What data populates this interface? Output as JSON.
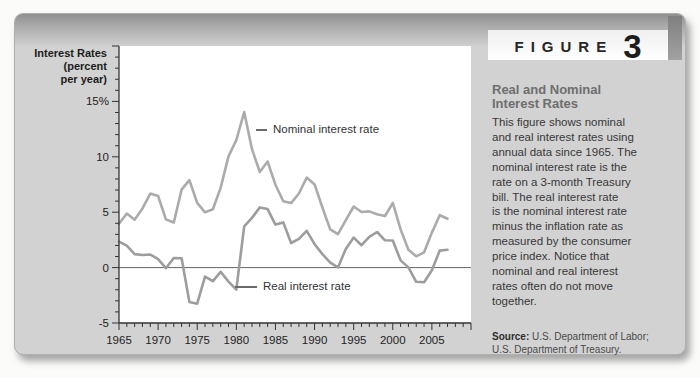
{
  "figure": {
    "label": "FIGURE",
    "number": "3"
  },
  "panel": {
    "heading": "Real and Nominal\nInterest Rates",
    "body": "This figure shows nominal\nand real interest rates using\nannual data since 1965. The\nnominal interest rate is the\nrate on a 3-month Treasury\nbill. The real interest rate\nis the nominal interest rate\nminus the inflation rate as\nmeasured by the consumer\nprice index. Notice that\nnominal and real interest\nrates often do not move\ntogether.",
    "source_label": "Source:",
    "source_text": " U.S. Department of Labor;\nU.S. Department of Treasury."
  },
  "chart_data": {
    "type": "line",
    "title": "",
    "y_axis_title": "Interest Rates\n(percent\nper year)",
    "xlabel": "",
    "ylabel": "Interest Rates (percent per year)",
    "xlim": [
      1965,
      2010
    ],
    "ylim": [
      -5,
      20
    ],
    "grid": false,
    "zero_line": true,
    "legend_position": "inline-annotations",
    "minor_tick_step_x": 1,
    "minor_tick_step_y": 1,
    "x": [
      1965,
      1966,
      1967,
      1968,
      1969,
      1970,
      1971,
      1972,
      1973,
      1974,
      1975,
      1976,
      1977,
      1978,
      1979,
      1980,
      1981,
      1982,
      1983,
      1984,
      1985,
      1986,
      1987,
      1988,
      1989,
      1990,
      1991,
      1992,
      1993,
      1994,
      1995,
      1996,
      1997,
      1998,
      1999,
      2000,
      2001,
      2002,
      2003,
      2004,
      2005,
      2006,
      2007
    ],
    "series": [
      {
        "name": "Nominal interest rate",
        "color": "#ababab",
        "values": [
          3.95,
          4.88,
          4.32,
          5.34,
          6.68,
          6.46,
          4.35,
          4.07,
          7.04,
          7.89,
          5.84,
          4.99,
          5.27,
          7.22,
          10.04,
          11.51,
          14.03,
          10.69,
          8.63,
          9.58,
          7.48,
          5.98,
          5.82,
          6.69,
          8.12,
          7.51,
          5.42,
          3.45,
          3.02,
          4.29,
          5.51,
          5.02,
          5.07,
          4.81,
          4.66,
          5.85,
          3.45,
          1.62,
          1.02,
          1.38,
          3.16,
          4.73,
          4.41
        ]
      },
      {
        "name": "Real interest rate",
        "color": "#9d9d9d",
        "values": [
          2.35,
          1.98,
          1.22,
          1.14,
          1.18,
          0.76,
          -0.05,
          0.87,
          0.84,
          -3.11,
          -3.26,
          -0.81,
          -1.23,
          -0.38,
          -1.26,
          -1.99,
          3.73,
          4.49,
          5.43,
          5.28,
          3.88,
          4.08,
          2.22,
          2.59,
          3.32,
          2.11,
          1.22,
          0.45,
          0.02,
          1.69,
          2.71,
          2.02,
          2.77,
          3.21,
          2.46,
          2.45,
          0.65,
          0.02,
          -1.28,
          -1.32,
          -0.24,
          1.53,
          1.61
        ]
      }
    ],
    "x_ticks": [
      {
        "v": 1965,
        "label": "1965"
      },
      {
        "v": 1970,
        "label": "1970"
      },
      {
        "v": 1975,
        "label": "1975"
      },
      {
        "v": 1980,
        "label": "1980"
      },
      {
        "v": 1985,
        "label": "1985"
      },
      {
        "v": 1990,
        "label": "1990"
      },
      {
        "v": 1995,
        "label": "1995"
      },
      {
        "v": 2000,
        "label": "2000"
      },
      {
        "v": 2005,
        "label": "2005"
      }
    ],
    "y_ticks": [
      {
        "v": 15,
        "label": "15%"
      },
      {
        "v": 10,
        "label": "10"
      },
      {
        "v": 5,
        "label": "5"
      },
      {
        "v": 0,
        "label": "0"
      },
      {
        "v": -5,
        "label": "-5"
      }
    ]
  },
  "colors": {
    "card_bg": "#d2d2d2",
    "band_top": "#8f8f8f",
    "plot_bg": "#ffffff",
    "axis": "#333333",
    "zero_line": "#555555",
    "heading": "#6e6e6e",
    "body_text": "#383838"
  }
}
